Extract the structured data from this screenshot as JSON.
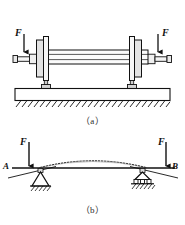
{
  "figure": {
    "title_semantic": "shaft-and-beam-model",
    "captions": {
      "a": "（a）",
      "b": "（b）"
    },
    "colors": {
      "line": "#1a1a1a",
      "fill_light": "#f2f2f2",
      "fill_mid": "#d9d9d9",
      "background": "#ffffff"
    }
  },
  "panel_a": {
    "name": "wheelset-on-rails",
    "loads": [
      {
        "label": "F",
        "side": "left",
        "direction": "down"
      },
      {
        "label": "F",
        "side": "right",
        "direction": "down"
      }
    ],
    "components": {
      "shaft": "axle-shaft",
      "wheel_left": "wheel-disc-left",
      "wheel_right": "wheel-disc-right",
      "journal_left": "journal-end-left",
      "journal_right": "journal-end-right",
      "rail_left": "rail-block-left",
      "rail_right": "rail-block-right",
      "foundation": "foundation-slab",
      "ground": "ground-hatching"
    }
  },
  "panel_b": {
    "name": "simply-supported-beam-model",
    "loads": [
      {
        "label": "F",
        "side": "left",
        "direction": "down"
      },
      {
        "label": "F",
        "side": "right",
        "direction": "down"
      }
    ],
    "node_labels": {
      "left": "A",
      "right": "B"
    },
    "supports": [
      {
        "type": "pin-support",
        "position": "left"
      },
      {
        "type": "roller-support",
        "position": "right"
      }
    ],
    "beam": "beam-axis-line",
    "deflection_curve": "deflected-shape-dashed"
  }
}
